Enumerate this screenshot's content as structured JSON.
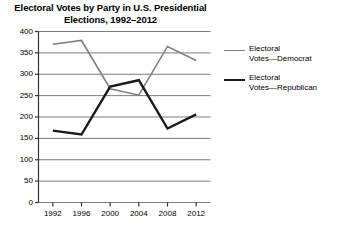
{
  "chart_data": {
    "type": "line",
    "title": "Electoral Votes by Party in U.S. Presidential Elections, 1992–2012",
    "title_line1": "Electoral Votes by Party in U.S. Presidential",
    "title_line2": "Elections, 1992–2012",
    "xlabel": "",
    "ylabel": "",
    "categories": [
      "1992",
      "1996",
      "2000",
      "2004",
      "2008",
      "2012"
    ],
    "x": [
      1992,
      1996,
      2000,
      2004,
      2008,
      2012
    ],
    "ylim": [
      0,
      400
    ],
    "yticks": [
      "0",
      "50",
      "100",
      "150",
      "200",
      "250",
      "300",
      "350",
      "400"
    ],
    "ytick_values": [
      0,
      50,
      100,
      150,
      200,
      250,
      300,
      350,
      400
    ],
    "grid": true,
    "grid_axis": "y",
    "legend_position": "right",
    "series": [
      {
        "name": "Electoral Votes—Democrat",
        "name_line1": "Electoral",
        "name_line2": "Votes—Democrat",
        "color": "#808080",
        "width": 1.6,
        "values": [
          370,
          379,
          266,
          251,
          365,
          332
        ]
      },
      {
        "name": "Electoral Votes—Republican",
        "name_line1": "Electoral",
        "name_line2": "Votes—Republican",
        "color": "#1a1a1a",
        "width": 2.4,
        "values": [
          168,
          159,
          271,
          286,
          173,
          206
        ]
      }
    ]
  },
  "axis": {
    "line_color": "#333333",
    "grid_color": "#7d7d7d"
  }
}
